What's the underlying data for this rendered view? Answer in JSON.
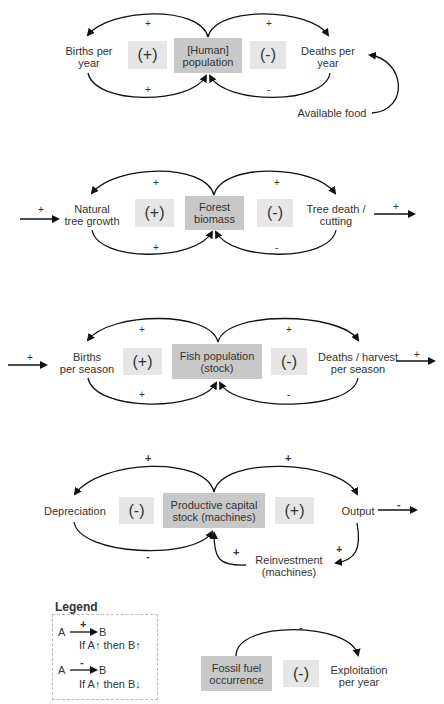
{
  "diagrams": [
    {
      "stock": [
        "[Human]",
        "population"
      ],
      "left_var": [
        "Births per",
        "year"
      ],
      "right_var": [
        "Deaths per",
        "year"
      ],
      "left_loop": "(+)",
      "right_loop": "(-)",
      "signs": {
        "top_left": "+",
        "top_right": "+",
        "bottom_left": "+",
        "bottom_right": "-"
      },
      "extra_var": "Available food"
    },
    {
      "stock": [
        "Forest",
        "biomass"
      ],
      "left_var": [
        "Natural",
        "tree growth"
      ],
      "right_var": [
        "Tree death /",
        "cutting"
      ],
      "left_loop": "(+)",
      "right_loop": "(-)",
      "signs": {
        "top_left": "+",
        "top_right": "+",
        "bottom_left": "+",
        "bottom_right": "-",
        "in": "+",
        "out": "+"
      }
    },
    {
      "stock": [
        "Fish population",
        "(stock)"
      ],
      "left_var": [
        "Births",
        "per season"
      ],
      "right_var": [
        "Deaths / harvest",
        "per season"
      ],
      "left_loop": "(+)",
      "right_loop": "(-)",
      "signs": {
        "top_left": "+",
        "top_right": "+",
        "bottom_left": "+",
        "bottom_right": "-",
        "in": "+",
        "out": "+"
      }
    },
    {
      "stock": [
        "Productive capital",
        "stock (machines)"
      ],
      "left_var": [
        "Depreciation"
      ],
      "right_var": [
        "Output"
      ],
      "bottom_var": [
        "Reinvestment",
        "(machines)"
      ],
      "left_loop": "(-)",
      "right_loop": "(+)",
      "signs": {
        "top_left": "+",
        "top_right": "+",
        "bottom_left": "-",
        "reinvest_in": "+",
        "reinvest_out": "+",
        "out": "-"
      }
    },
    {
      "stock": [
        "Fossil fuel",
        "occurrence"
      ],
      "right_var": [
        "Exploitation",
        "per year"
      ],
      "loop": "(-)",
      "signs": {
        "top": "-"
      }
    }
  ],
  "legend": {
    "title": "Legend",
    "items": [
      {
        "from": "A",
        "to": "B",
        "sign": "+",
        "desc": "If A↑ then B↑"
      },
      {
        "from": "A",
        "to": "B",
        "sign": "-",
        "desc": "If A↑ then B↓"
      }
    ]
  }
}
